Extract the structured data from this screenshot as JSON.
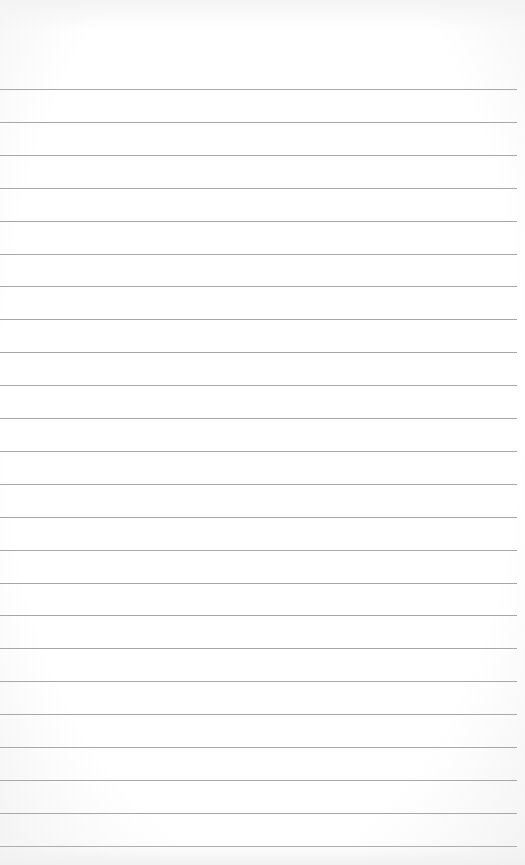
{
  "paper": {
    "type": "lined-notepad",
    "background_color": "#ffffff",
    "line_color": "#a8a8a8",
    "first_line_y": 89,
    "line_spacing": 32.9,
    "line_count": 24,
    "lines": [
      "",
      "",
      "",
      "",
      "",
      "",
      "",
      "",
      "",
      "",
      "",
      "",
      "",
      "",
      "",
      "",
      "",
      "",
      "",
      "",
      "",
      "",
      "",
      ""
    ]
  }
}
